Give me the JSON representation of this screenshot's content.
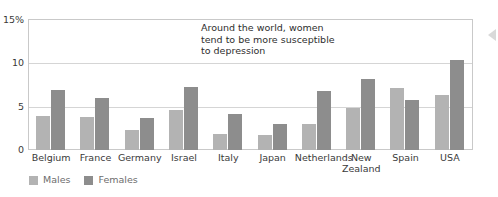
{
  "chart_data": {
    "type": "bar",
    "title": "",
    "xlabel": "",
    "ylabel": "",
    "ylim": [
      0,
      15
    ],
    "yticks": [
      "0",
      "5",
      "10",
      "15%"
    ],
    "ytick_values": [
      0,
      5,
      10,
      15
    ],
    "grid": true,
    "legend_position": "bottom-left",
    "categories": [
      "Belgium",
      "France",
      "Germany",
      "Israel",
      "Italy",
      "Japan",
      "Netherlands",
      "New\nZealand",
      "Spain",
      "USA"
    ],
    "series": [
      {
        "name": "Males",
        "color": "#b3b3b3",
        "values": [
          3.9,
          3.8,
          2.3,
          4.6,
          1.8,
          1.7,
          3.0,
          4.9,
          7.1,
          6.4
        ]
      },
      {
        "name": "Females",
        "color": "#8d8d8d",
        "values": [
          6.9,
          6.0,
          3.7,
          7.3,
          4.2,
          3.0,
          6.8,
          8.2,
          5.8,
          10.4
        ]
      }
    ],
    "annotations": [
      {
        "text": "Around the world, women\ntend to be more susceptible\nto depression"
      }
    ]
  },
  "annotation": {
    "text": "Around the world, women\ntend to be more susceptible\nto depression"
  },
  "legend": {
    "males_label": "Males",
    "females_label": "Females"
  },
  "colors": {
    "male_bar": "#b3b3b3",
    "female_bar": "#8d8d8d",
    "frame": "#c9c9c9",
    "gridline": "#d5d5d5",
    "axis_text": "#3a3a3a"
  }
}
